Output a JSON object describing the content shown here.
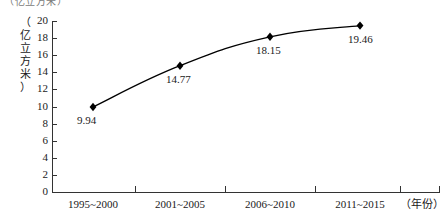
{
  "top_caption": "（亿立方米）",
  "chart_data": {
    "type": "line",
    "title": "",
    "xlabel": "（年份）",
    "ylabel": "（亿立方米）",
    "categories": [
      "1995~2000",
      "2001~2005",
      "2006~2010",
      "2011~2015"
    ],
    "values": [
      9.94,
      14.77,
      18.15,
      19.46
    ],
    "point_labels": [
      "9.94",
      "14.77",
      "18.15",
      "19.46"
    ],
    "ylim": [
      0,
      20
    ],
    "yticks": [
      20,
      18,
      16,
      14,
      12,
      10,
      8,
      6,
      4,
      2,
      0
    ],
    "ytick_labels": [
      "20",
      "18",
      "16",
      "14",
      "12",
      "10",
      "8",
      "6",
      "4",
      "2",
      "0"
    ],
    "grid": false,
    "legend": false,
    "marker": "diamond",
    "line_color": "#000000",
    "marker_color": "#000000"
  },
  "ylabel_chars": [
    "（",
    "亿",
    "立",
    "方",
    "米",
    "）"
  ]
}
